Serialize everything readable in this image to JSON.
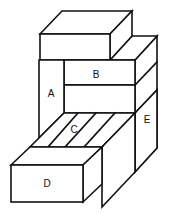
{
  "diagram": {
    "type": "isometric-block-assembly",
    "labels": {
      "A": "A",
      "B": "B",
      "C": "C",
      "D": "D",
      "E": "E"
    },
    "colors": {
      "stroke": "#111111",
      "fill": "#ffffff"
    }
  }
}
